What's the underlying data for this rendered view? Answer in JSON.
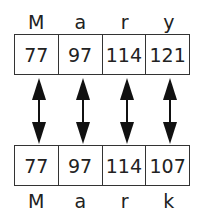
{
  "top": {
    "word": "Mary",
    "letters": [
      "M",
      "a",
      "r",
      "y"
    ],
    "codes": [
      "77",
      "97",
      "114",
      "121"
    ]
  },
  "bottom": {
    "word": "Mark",
    "letters": [
      "M",
      "a",
      "r",
      "k"
    ],
    "codes": [
      "77",
      "97",
      "114",
      "107"
    ]
  },
  "arrows": {
    "count": 4,
    "type": "double-headed",
    "color": "#111111"
  }
}
